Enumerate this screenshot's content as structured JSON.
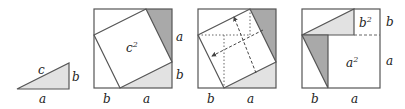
{
  "colors": {
    "stroke": "#555555",
    "dark_fill": "#a9a9a9",
    "light_fill": "#e2e2e2",
    "background": "#ffffff",
    "text": "#222222"
  },
  "panel1": {
    "hyp": "c",
    "leg_vertical": "b",
    "leg_horizontal": "a"
  },
  "panel2": {
    "center": "c",
    "center_exp": "2",
    "right_top": "a",
    "right_bottom": "b",
    "bottom_left": "b",
    "bottom_right": "a"
  },
  "panel3": {
    "bottom_left": "b",
    "bottom_right": "a"
  },
  "panel4": {
    "small_square": "b",
    "small_square_exp": "2",
    "big_square": "a",
    "big_square_exp": "2",
    "right_top": "b",
    "right_bottom": "a",
    "bottom_left": "b",
    "bottom_right": "a"
  }
}
